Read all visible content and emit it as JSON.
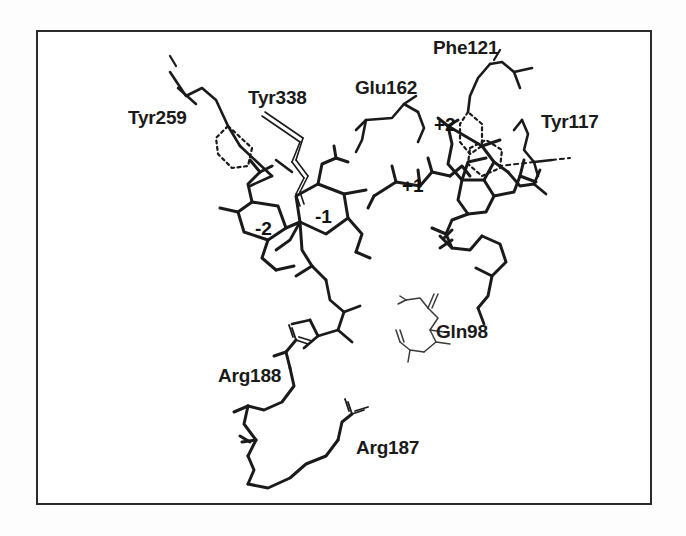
{
  "figure": {
    "background_color": "#fdfdfd",
    "frame_color": "#2b2b2b",
    "ink_color": "#1a1a1a"
  },
  "residue_labels": [
    {
      "id": "tyr259",
      "text": "Tyr259",
      "x": 128,
      "y": 108
    },
    {
      "id": "tyr338",
      "text": "Tyr338",
      "x": 248,
      "y": 88
    },
    {
      "id": "glu162",
      "text": "Glu162",
      "x": 355,
      "y": 78
    },
    {
      "id": "phe121",
      "text": "Phe121",
      "x": 433,
      "y": 38
    },
    {
      "id": "tyr117",
      "text": "Tyr117",
      "x": 541,
      "y": 112
    },
    {
      "id": "gln98",
      "text": "Gln98",
      "x": 436,
      "y": 322
    },
    {
      "id": "arg188",
      "text": "Arg188",
      "x": 218,
      "y": 366
    },
    {
      "id": "arg187",
      "text": "Arg187",
      "x": 356,
      "y": 438
    }
  ],
  "subsite_labels": [
    {
      "id": "minus-two",
      "text": "-2",
      "x": 255,
      "y": 219
    },
    {
      "id": "minus-one",
      "text": "-1",
      "x": 315,
      "y": 207
    },
    {
      "id": "plus-one",
      "text": "+1",
      "x": 402,
      "y": 176
    },
    {
      "id": "plus-two",
      "text": "+2",
      "x": 434,
      "y": 115
    }
  ]
}
